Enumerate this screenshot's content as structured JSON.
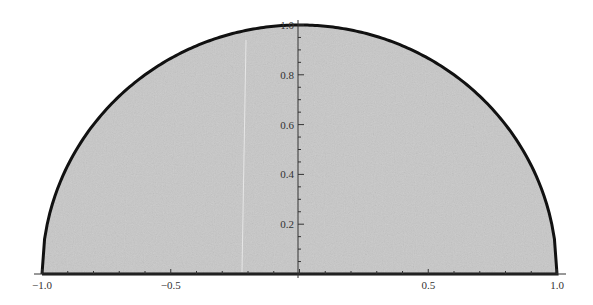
{
  "chart_data": {
    "type": "area",
    "title": "",
    "xlabel": "",
    "ylabel": "",
    "function": "sqrt(1 - x^2)",
    "xlim": [
      -1.0,
      1.0
    ],
    "ylim": [
      0,
      1.0
    ],
    "grid": false,
    "legend": null,
    "x_ticks": [
      {
        "value": -1.0,
        "label": "-1.0"
      },
      {
        "value": -0.5,
        "label": "-0.5"
      },
      {
        "value": 0.5,
        "label": "0.5"
      },
      {
        "value": 1.0,
        "label": "1.0"
      }
    ],
    "y_ticks": [
      {
        "value": 0.2,
        "label": "0.2"
      },
      {
        "value": 0.4,
        "label": "0.4"
      },
      {
        "value": 0.6,
        "label": "0.6"
      },
      {
        "value": 0.8,
        "label": "0.8"
      },
      {
        "value": 1.0,
        "label": "1.0"
      }
    ],
    "x": [
      -1.0,
      -0.9,
      -0.8,
      -0.7,
      -0.6,
      -0.5,
      -0.4,
      -0.3,
      -0.2,
      -0.1,
      0.0,
      0.1,
      0.2,
      0.3,
      0.4,
      0.5,
      0.6,
      0.7,
      0.8,
      0.9,
      1.0
    ],
    "values": [
      0.0,
      0.436,
      0.6,
      0.714,
      0.8,
      0.866,
      0.917,
      0.954,
      0.98,
      0.995,
      1.0,
      0.995,
      0.98,
      0.954,
      0.917,
      0.866,
      0.8,
      0.714,
      0.6,
      0.436,
      0.0
    ],
    "colors": {
      "fill": "#c8c8c8",
      "outline": "#111111",
      "axis": "#333333"
    }
  }
}
